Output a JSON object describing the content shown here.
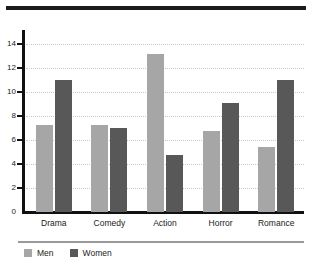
{
  "chart_data": {
    "type": "bar",
    "title": "",
    "subtitle": "",
    "xlabel": "",
    "ylabel": "",
    "categories": [
      "Drama",
      "Comedy",
      "Action",
      "Horror",
      "Romance"
    ],
    "series": [
      {
        "name": "Men",
        "color": "#a6a6a6",
        "values": [
          7.3,
          7.3,
          13.2,
          6.8,
          5.4
        ]
      },
      {
        "name": "Women",
        "color": "#585858",
        "values": [
          11.0,
          7.0,
          4.8,
          9.1,
          11.0
        ]
      }
    ],
    "ylim": [
      0,
      14.7
    ],
    "yticks": [
      0,
      2,
      4,
      6,
      8,
      10,
      12,
      14
    ],
    "ytick_labels": [
      "0",
      "2",
      "4",
      "6",
      "8",
      "10",
      "12",
      "14"
    ],
    "gridlines": [
      2,
      4,
      6,
      8,
      10,
      12,
      14
    ],
    "grid": true,
    "grid_style": "dotted",
    "grid_color": "#c9c9c9",
    "legend_position": "bottom-left",
    "axis_color": "#111111",
    "background": "#ffffff"
  },
  "decoration": {
    "top_rule_color": "#1b1b1b",
    "legend_rule_color": "#9a9a9a"
  }
}
